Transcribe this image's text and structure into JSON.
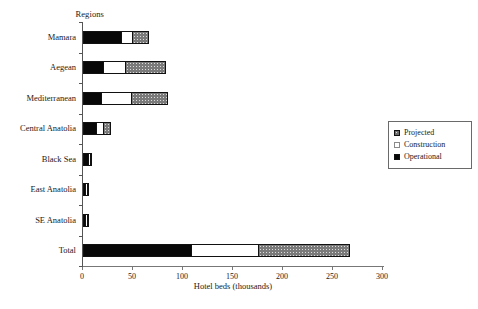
{
  "chart_data": {
    "type": "bar",
    "orientation": "horizontal",
    "stacked": true,
    "title": "",
    "ylabel": "Regions",
    "xlabel": "Hotel beds (thousands)",
    "xlim": [
      0,
      300
    ],
    "xticks": [
      0,
      50,
      100,
      150,
      200,
      250,
      300
    ],
    "xtick_labels": [
      "0",
      "50",
      "100",
      "150",
      "200",
      "250",
      "300"
    ],
    "grid": false,
    "legend_position": "right",
    "categories": [
      "Mamara",
      "Aegean",
      "Mediterranean",
      "Central Anatolia",
      "Black Sea",
      "East Anatolia",
      "SE Anatolia",
      "Total"
    ],
    "series": [
      {
        "name": "Operational",
        "color": "#080808",
        "values": [
          38,
          20,
          18,
          13,
          5,
          2,
          2,
          108
        ]
      },
      {
        "name": "Construction",
        "color": "#ffffff",
        "values": [
          11,
          22,
          30,
          7,
          1,
          0.5,
          0.5,
          67
        ]
      },
      {
        "name": "Projected",
        "color": "#7a7a7a",
        "values": [
          17,
          41,
          37,
          8,
          1,
          0.5,
          0.5,
          92
        ]
      }
    ],
    "totals": [
      66,
      83,
      85,
      28,
      7,
      3,
      3,
      267
    ]
  },
  "legend": {
    "items": [
      {
        "label": "Projected",
        "swatch": "projected"
      },
      {
        "label": "Construction",
        "swatch": "construction"
      },
      {
        "label": "Operational",
        "swatch": "operational"
      }
    ]
  }
}
